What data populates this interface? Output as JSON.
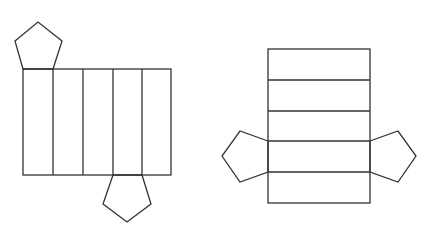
{
  "diagram": {
    "stroke_color": "#333333",
    "background": "#ffffff",
    "nets": [
      {
        "id": "net-left",
        "lateral_faces": {
          "orientation": "vertical-strips",
          "count": 5,
          "rect": {
            "x": 23,
            "y": 69,
            "w": 148,
            "h": 106
          },
          "dividers": [
            53,
            83,
            113,
            142
          ]
        },
        "bases": [
          {
            "position": "top-left",
            "points": "23,69 15,41 38,22 62,41 53,69"
          },
          {
            "position": "bottom",
            "points": "113,175 103,204 127,222 151,204 142,175"
          }
        ]
      },
      {
        "id": "net-right",
        "lateral_faces": {
          "orientation": "horizontal-strips",
          "count": 5,
          "rect": {
            "x": 268,
            "y": 49,
            "w": 102,
            "h": 154
          },
          "dividers": [
            80,
            111,
            141,
            172
          ]
        },
        "bases": [
          {
            "position": "left",
            "points": "268,141 240,131 222,156 240,182 268,172"
          },
          {
            "position": "right",
            "points": "370,141 398,131 416,156 398,182 370,172"
          }
        ]
      }
    ]
  }
}
